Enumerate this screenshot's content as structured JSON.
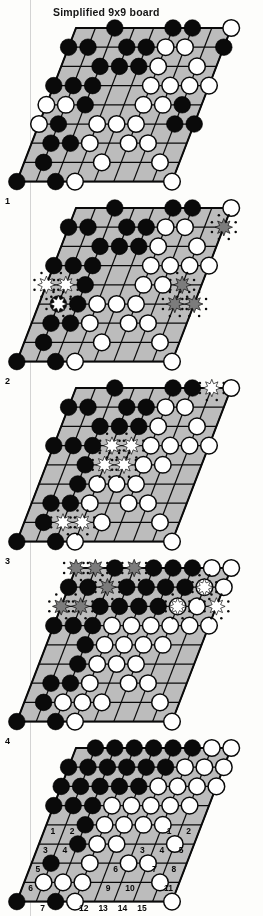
{
  "figure": {
    "title": "Simplified 9x9 board",
    "kind": "go-board-sequence",
    "board_size": 9,
    "panel_count": 5,
    "projection": "sheared-parallelogram",
    "ink_color": "#111111",
    "board_fill": "#b9b9b4",
    "stone_black": "#111111",
    "stone_white": "#fdfdfd",
    "marker_capture_white": "#ffffff",
    "marker_capture_black": "#7d7d78"
  },
  "panels": [
    {
      "label": "1",
      "caption": "",
      "black": [
        [
          2,
          0
        ],
        [
          5,
          0
        ],
        [
          6,
          0
        ],
        [
          0,
          1
        ],
        [
          1,
          1
        ],
        [
          3,
          1
        ],
        [
          4,
          1
        ],
        [
          8,
          1
        ],
        [
          2,
          2
        ],
        [
          3,
          2
        ],
        [
          4,
          2
        ],
        [
          0,
          3
        ],
        [
          1,
          3
        ],
        [
          2,
          3
        ],
        [
          2,
          4
        ],
        [
          7,
          4
        ],
        [
          1,
          5
        ],
        [
          7,
          5
        ],
        [
          8,
          5
        ],
        [
          1,
          6
        ],
        [
          2,
          6
        ],
        [
          1,
          7
        ],
        [
          0,
          8
        ],
        [
          2,
          8
        ]
      ],
      "white": [
        [
          8,
          0
        ],
        [
          5,
          1
        ],
        [
          6,
          1
        ],
        [
          5,
          2
        ],
        [
          7,
          2
        ],
        [
          5,
          3
        ],
        [
          6,
          3
        ],
        [
          7,
          3
        ],
        [
          8,
          3
        ],
        [
          0,
          4
        ],
        [
          1,
          4
        ],
        [
          5,
          4
        ],
        [
          6,
          4
        ],
        [
          0,
          5
        ],
        [
          3,
          5
        ],
        [
          4,
          5
        ],
        [
          5,
          5
        ],
        [
          3,
          6
        ],
        [
          5,
          6
        ],
        [
          6,
          6
        ],
        [
          4,
          7
        ],
        [
          7,
          7
        ],
        [
          3,
          8
        ],
        [
          8,
          8
        ]
      ],
      "capture_white": [],
      "capture_black": [],
      "numbers_left": [],
      "numbers_right": []
    },
    {
      "label": "2",
      "caption": "",
      "black": [
        [
          2,
          0
        ],
        [
          5,
          0
        ],
        [
          6,
          0
        ],
        [
          0,
          1
        ],
        [
          1,
          1
        ],
        [
          3,
          1
        ],
        [
          4,
          1
        ],
        [
          2,
          2
        ],
        [
          3,
          2
        ],
        [
          4,
          2
        ],
        [
          0,
          3
        ],
        [
          1,
          3
        ],
        [
          2,
          3
        ],
        [
          2,
          4
        ],
        [
          1,
          5
        ],
        [
          2,
          5
        ],
        [
          1,
          6
        ],
        [
          2,
          6
        ],
        [
          1,
          7
        ],
        [
          0,
          8
        ],
        [
          2,
          8
        ]
      ],
      "white": [
        [
          8,
          0
        ],
        [
          5,
          1
        ],
        [
          6,
          1
        ],
        [
          5,
          2
        ],
        [
          7,
          2
        ],
        [
          5,
          3
        ],
        [
          6,
          3
        ],
        [
          7,
          3
        ],
        [
          8,
          3
        ],
        [
          5,
          4
        ],
        [
          6,
          4
        ],
        [
          3,
          5
        ],
        [
          4,
          5
        ],
        [
          5,
          5
        ],
        [
          3,
          6
        ],
        [
          5,
          6
        ],
        [
          6,
          6
        ],
        [
          4,
          7
        ],
        [
          7,
          7
        ],
        [
          3,
          8
        ],
        [
          8,
          8
        ]
      ],
      "capture_white": [
        [
          0,
          4
        ],
        [
          1,
          4
        ],
        [
          1,
          5
        ]
      ],
      "capture_black": [
        [
          8,
          1
        ],
        [
          7,
          4
        ],
        [
          7,
          5
        ],
        [
          8,
          5
        ]
      ],
      "numbers_left": [],
      "numbers_right": []
    },
    {
      "label": "3",
      "caption": "",
      "black": [
        [
          2,
          0
        ],
        [
          5,
          0
        ],
        [
          6,
          0
        ],
        [
          0,
          1
        ],
        [
          1,
          1
        ],
        [
          3,
          1
        ],
        [
          4,
          1
        ],
        [
          2,
          2
        ],
        [
          3,
          2
        ],
        [
          4,
          2
        ],
        [
          0,
          3
        ],
        [
          1,
          3
        ],
        [
          2,
          3
        ],
        [
          2,
          4
        ],
        [
          2,
          5
        ],
        [
          1,
          6
        ],
        [
          2,
          6
        ],
        [
          1,
          7
        ],
        [
          0,
          8
        ],
        [
          2,
          8
        ]
      ],
      "white": [
        [
          8,
          0
        ],
        [
          5,
          1
        ],
        [
          6,
          1
        ],
        [
          5,
          2
        ],
        [
          7,
          2
        ],
        [
          5,
          3
        ],
        [
          6,
          3
        ],
        [
          7,
          3
        ],
        [
          8,
          3
        ],
        [
          5,
          4
        ],
        [
          6,
          4
        ],
        [
          3,
          5
        ],
        [
          4,
          5
        ],
        [
          5,
          5
        ],
        [
          3,
          6
        ],
        [
          5,
          6
        ],
        [
          6,
          6
        ],
        [
          4,
          7
        ],
        [
          7,
          7
        ],
        [
          3,
          8
        ],
        [
          8,
          8
        ]
      ],
      "capture_white": [
        [
          3,
          3
        ],
        [
          4,
          3
        ],
        [
          3,
          4
        ],
        [
          4,
          4
        ],
        [
          2,
          7
        ],
        [
          3,
          7
        ],
        [
          7,
          0
        ]
      ],
      "capture_black": [],
      "numbers_left": [],
      "numbers_right": []
    },
    {
      "label": "4",
      "caption": "",
      "black": [
        [
          2,
          0
        ],
        [
          4,
          0
        ],
        [
          5,
          0
        ],
        [
          6,
          0
        ],
        [
          0,
          1
        ],
        [
          1,
          1
        ],
        [
          3,
          1
        ],
        [
          4,
          1
        ],
        [
          5,
          1
        ],
        [
          6,
          1
        ],
        [
          2,
          2
        ],
        [
          3,
          2
        ],
        [
          4,
          2
        ],
        [
          5,
          2
        ],
        [
          0,
          3
        ],
        [
          1,
          3
        ],
        [
          2,
          3
        ],
        [
          2,
          4
        ],
        [
          2,
          5
        ],
        [
          1,
          6
        ],
        [
          2,
          6
        ],
        [
          1,
          7
        ],
        [
          0,
          8
        ],
        [
          2,
          8
        ]
      ],
      "white": [
        [
          7,
          0
        ],
        [
          8,
          0
        ],
        [
          7,
          1
        ],
        [
          8,
          1
        ],
        [
          6,
          2
        ],
        [
          7,
          2
        ],
        [
          6,
          3
        ],
        [
          7,
          3
        ],
        [
          8,
          3
        ],
        [
          3,
          3
        ],
        [
          4,
          3
        ],
        [
          5,
          3
        ],
        [
          3,
          4
        ],
        [
          4,
          4
        ],
        [
          5,
          4
        ],
        [
          6,
          4
        ],
        [
          3,
          5
        ],
        [
          4,
          5
        ],
        [
          5,
          5
        ],
        [
          3,
          6
        ],
        [
          5,
          6
        ],
        [
          6,
          6
        ],
        [
          2,
          7
        ],
        [
          3,
          7
        ],
        [
          4,
          7
        ],
        [
          7,
          7
        ],
        [
          3,
          8
        ],
        [
          8,
          8
        ]
      ],
      "capture_white": [
        [
          7,
          1
        ],
        [
          6,
          2
        ],
        [
          8,
          2
        ]
      ],
      "capture_black": [
        [
          0,
          0
        ],
        [
          1,
          0
        ],
        [
          3,
          0
        ],
        [
          2,
          1
        ],
        [
          0,
          2
        ],
        [
          1,
          2
        ]
      ],
      "numbers_left": [],
      "numbers_right": []
    },
    {
      "label": "",
      "caption": "",
      "black": [
        [
          1,
          0
        ],
        [
          2,
          0
        ],
        [
          3,
          0
        ],
        [
          4,
          0
        ],
        [
          5,
          0
        ],
        [
          6,
          0
        ],
        [
          0,
          1
        ],
        [
          1,
          1
        ],
        [
          2,
          1
        ],
        [
          3,
          1
        ],
        [
          4,
          1
        ],
        [
          5,
          1
        ],
        [
          0,
          2
        ],
        [
          1,
          2
        ],
        [
          2,
          2
        ],
        [
          3,
          2
        ],
        [
          4,
          2
        ],
        [
          0,
          3
        ],
        [
          1,
          3
        ],
        [
          2,
          3
        ],
        [
          2,
          4
        ],
        [
          2,
          5
        ],
        [
          1,
          6
        ],
        [
          0,
          8
        ],
        [
          2,
          8
        ]
      ],
      "white": [
        [
          7,
          0
        ],
        [
          8,
          0
        ],
        [
          6,
          1
        ],
        [
          7,
          1
        ],
        [
          8,
          1
        ],
        [
          5,
          2
        ],
        [
          6,
          2
        ],
        [
          7,
          2
        ],
        [
          8,
          2
        ],
        [
          3,
          3
        ],
        [
          4,
          3
        ],
        [
          5,
          3
        ],
        [
          6,
          3
        ],
        [
          7,
          3
        ],
        [
          3,
          4
        ],
        [
          4,
          4
        ],
        [
          5,
          4
        ],
        [
          6,
          4
        ],
        [
          3,
          5
        ],
        [
          4,
          5
        ],
        [
          7,
          5
        ],
        [
          3,
          6
        ],
        [
          5,
          6
        ],
        [
          6,
          6
        ],
        [
          1,
          7
        ],
        [
          2,
          7
        ],
        [
          3,
          7
        ],
        [
          7,
          7
        ],
        [
          3,
          8
        ],
        [
          8,
          8
        ]
      ],
      "capture_white": [],
      "capture_black": [],
      "numbers_left": [
        {
          "n": "1",
          "col": 0,
          "row": 4
        },
        {
          "n": "2",
          "col": 1,
          "row": 4
        },
        {
          "n": "3",
          "col": 0,
          "row": 5
        },
        {
          "n": "4",
          "col": 1,
          "row": 5
        },
        {
          "n": "5",
          "col": 0,
          "row": 6
        },
        {
          "n": "6",
          "col": 0,
          "row": 7
        },
        {
          "n": "7",
          "col": 1,
          "row": 8
        }
      ],
      "numbers_right": [
        {
          "n": "1",
          "col": 6,
          "row": 4
        },
        {
          "n": "2",
          "col": 7,
          "row": 4
        },
        {
          "n": "3",
          "col": 5,
          "row": 5
        },
        {
          "n": "4",
          "col": 6,
          "row": 5
        },
        {
          "n": "5",
          "col": 7,
          "row": 5
        },
        {
          "n": "6",
          "col": 4,
          "row": 6
        },
        {
          "n": "7",
          "col": 6,
          "row": 6
        },
        {
          "n": "8",
          "col": 7,
          "row": 6
        },
        {
          "n": "9",
          "col": 4,
          "row": 7
        },
        {
          "n": "10",
          "col": 5,
          "row": 7
        },
        {
          "n": "11",
          "col": 7,
          "row": 7
        },
        {
          "n": "12",
          "col": 3,
          "row": 8
        },
        {
          "n": "13",
          "col": 4,
          "row": 8
        },
        {
          "n": "14",
          "col": 5,
          "row": 8
        },
        {
          "n": "15",
          "col": 6,
          "row": 8
        }
      ]
    }
  ],
  "panel_labels": [
    {
      "text": "1",
      "x": 5,
      "y": 196
    },
    {
      "text": "2",
      "x": 5,
      "y": 376
    },
    {
      "text": "3",
      "x": 5,
      "y": 556
    },
    {
      "text": "4",
      "x": 5,
      "y": 736
    }
  ]
}
